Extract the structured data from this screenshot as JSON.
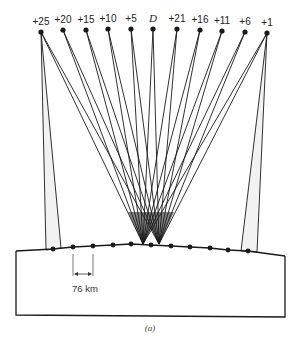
{
  "figure": {
    "caption": "(a)",
    "scale_label": "76 km",
    "colors": {
      "ink": "#1a1a1a",
      "fill": "#f2f2f2",
      "background": "#ffffff"
    }
  },
  "satellites": [
    {
      "label": "+25",
      "x": 41,
      "y": 32
    },
    {
      "label": "+20",
      "x": 63,
      "y": 30
    },
    {
      "label": "+15",
      "x": 86,
      "y": 30
    },
    {
      "label": "+10",
      "x": 108,
      "y": 29
    },
    {
      "label": "+5",
      "x": 131,
      "y": 29
    },
    {
      "label": "D",
      "x": 153,
      "y": 29
    },
    {
      "label": "+21",
      "x": 177,
      "y": 29
    },
    {
      "label": "+16",
      "x": 200,
      "y": 30
    },
    {
      "label": "+11",
      "x": 222,
      "y": 31
    },
    {
      "label": "+6",
      "x": 245,
      "y": 32
    },
    {
      "label": "+1",
      "x": 267,
      "y": 33
    }
  ],
  "ground_stations": [
    {
      "x": 53,
      "y": 249
    },
    {
      "x": 73,
      "y": 247
    },
    {
      "x": 93,
      "y": 246
    },
    {
      "x": 113,
      "y": 245
    },
    {
      "x": 131,
      "y": 244
    },
    {
      "x": 151,
      "y": 245
    },
    {
      "x": 171,
      "y": 246
    },
    {
      "x": 190,
      "y": 247
    },
    {
      "x": 210,
      "y": 248
    },
    {
      "x": 228,
      "y": 250
    },
    {
      "x": 248,
      "y": 251
    }
  ],
  "convergence_points": [
    {
      "x": 143,
      "y": 245
    },
    {
      "x": 159,
      "y": 245
    }
  ]
}
